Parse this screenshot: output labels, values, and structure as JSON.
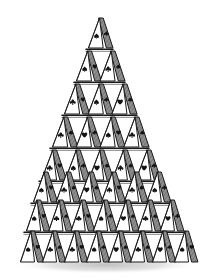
{
  "artwork": {
    "title": "House of Cards",
    "subject": "card-pyramid",
    "style": "grayscale-line-art",
    "background_color": "#ffffff",
    "ink_color": "#1a1a1a",
    "card_face_color": "#ffffff",
    "card_shade_color": "#8c8c8c",
    "card_shade_dark": "#6e6e6e",
    "hatch_color": "#5a5a5a",
    "shadow_color": "#c9c9c9",
    "pip_color": "#141414"
  },
  "geometry": {
    "canvas_width": 212,
    "canvas_height": 277,
    "tier_count": 8,
    "apex_x": 99,
    "apex_y": 18,
    "base_y": 262,
    "base_left_x": 20,
    "base_right_x": 196,
    "tier_height": 30.5,
    "card_half_width": 11.2,
    "tier_gap": 3.0
  },
  "tiers": [
    {
      "index": 1,
      "triangle_count": 1,
      "y_top": 18,
      "y_bottom": 48,
      "left_x": 88,
      "right_x": 111
    },
    {
      "index": 2,
      "triangle_count": 2,
      "y_top": 51,
      "y_bottom": 81,
      "left_x": 76,
      "right_x": 123
    },
    {
      "index": 3,
      "triangle_count": 3,
      "y_top": 84,
      "y_bottom": 114,
      "left_x": 64,
      "right_x": 135
    },
    {
      "index": 4,
      "triangle_count": 4,
      "y_top": 117,
      "y_bottom": 147,
      "left_x": 52,
      "right_x": 147
    },
    {
      "index": 5,
      "triangle_count": 5,
      "y_top": 150,
      "y_bottom": 180,
      "left_x": 41,
      "right_x": 159
    },
    {
      "index": 6,
      "triangle_count": 6,
      "y_top": 172,
      "y_bottom": 202,
      "left_x": 33,
      "right_x": 169
    },
    {
      "index": 7,
      "triangle_count": 7,
      "y_top": 200,
      "y_bottom": 231,
      "left_x": 26,
      "right_x": 182
    },
    {
      "index": 8,
      "triangle_count": 8,
      "y_top": 231,
      "y_bottom": 262,
      "left_x": 20,
      "right_x": 196
    }
  ],
  "pips": {
    "symbols": [
      "spade",
      "club",
      "heart",
      "diamond"
    ],
    "sequence": [
      "spade",
      "club",
      "spade",
      "heart",
      "club",
      "spade",
      "club",
      "heart",
      "spade",
      "club",
      "heart",
      "spade",
      "club",
      "spade",
      "heart",
      "club",
      "spade",
      "heart",
      "club",
      "spade",
      "club",
      "heart",
      "spade",
      "club",
      "heart",
      "spade",
      "club",
      "spade",
      "heart",
      "club",
      "spade",
      "heart",
      "club",
      "spade",
      "heart",
      "spade",
      "club",
      "heart",
      "club",
      "spade"
    ]
  },
  "shadow": {
    "center_x": 106,
    "center_y": 265,
    "radius_x": 92,
    "radius_y": 9
  }
}
